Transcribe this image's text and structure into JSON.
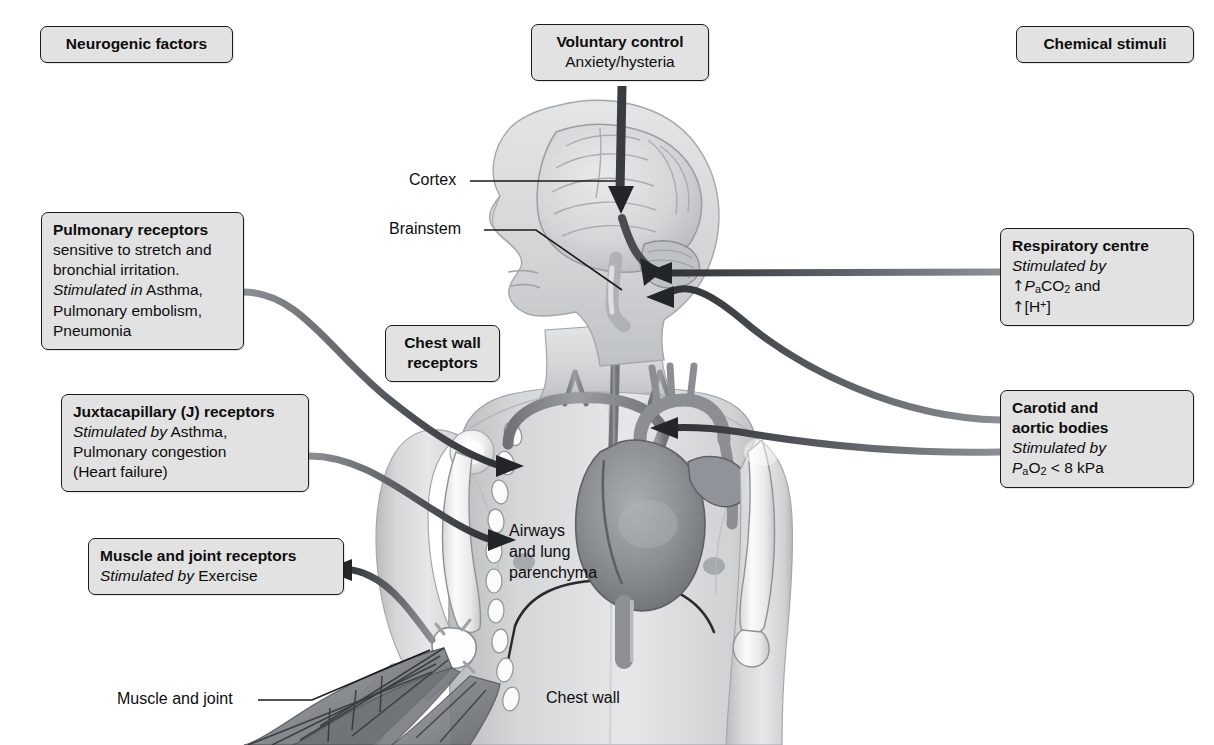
{
  "diagram": {
    "background_color": "#ffffff",
    "box_fill": "#e2e2e2",
    "box_border": "#1b1b1b",
    "arrow_color": "#3a3a3a",
    "body_tint": "#c9cbcd"
  },
  "headers": {
    "left": "Neurogenic factors",
    "right": "Chemical stimuli"
  },
  "boxes": {
    "voluntary_control": {
      "heading": "Voluntary control",
      "line1": "Anxiety/hysteria"
    },
    "pulmonary_receptors": {
      "heading": "Pulmonary receptors",
      "line1": "sensitive to stretch and",
      "line2": "bronchial irritation.",
      "line3_em": "Stimulated in",
      "line3_rest": "Asthma,",
      "line4": "Pulmonary embolism,",
      "line5": "Pneumonia"
    },
    "chest_wall_receptors": {
      "line1": "Chest wall",
      "line2": "receptors"
    },
    "juxtacapillary_receptors": {
      "heading": "Juxtacapillary (J) receptors",
      "line1_em": "Stimulated by",
      "line1_rest": "Asthma,",
      "line2": "Pulmonary congestion",
      "line3": "(Heart failure)"
    },
    "muscle_joint_receptors": {
      "heading": "Muscle and joint receptors",
      "line1_em": "Stimulated by",
      "line1_rest": "Exercise"
    },
    "respiratory_centre": {
      "heading": "Respiratory centre",
      "line1_em": "Stimulated by",
      "line2_arrow": "↑",
      "line2_p": "P",
      "line2_sub": "a",
      "line2_gas": "CO",
      "line2_gas_sub": "2",
      "line2_tail": " and",
      "line3_arrow": "↑",
      "line3_text": "[H",
      "line3_sup": "+",
      "line3_tail": "]"
    },
    "carotid_aortic_bodies": {
      "heading_line1": "Carotid and",
      "heading_line2": "aortic bodies",
      "line1_em": "Stimulated by",
      "line2_p": "P",
      "line2_sub": "a",
      "line2_gas": "O",
      "line2_gas_sub": "2",
      "line2_tail": " < 8 kPa"
    }
  },
  "anatomy_labels": {
    "cortex": "Cortex",
    "brainstem": "Brainstem",
    "airways": "Airways\nand lung\nparenchyma",
    "airways_l1": "Airways",
    "airways_l2": "and lung",
    "airways_l3": "parenchyma",
    "chest_wall": "Chest wall",
    "muscle_and_joint": "Muscle and joint"
  },
  "arrows": [
    {
      "name": "voluntary-to-cortex",
      "from": "voluntary_control",
      "to": "cortex",
      "style": "straight-down"
    },
    {
      "name": "cortex-to-brainstem",
      "from": "cortex",
      "to": "brainstem",
      "style": "curved"
    },
    {
      "name": "respiratory-centre-to-brainstem",
      "from": "respiratory_centre",
      "to": "brainstem",
      "style": "straight-left"
    },
    {
      "name": "carotid-bodies-to-brainstem",
      "from": "carotid_aortic_bodies",
      "to": "brainstem",
      "style": "curved-left"
    },
    {
      "name": "carotid-bodies-to-aortic-arch",
      "from": "carotid_aortic_bodies",
      "to": "aortic_arch",
      "style": "curved-left"
    },
    {
      "name": "pulmonary-receptors-to-lung",
      "from": "pulmonary_receptors",
      "to": "lung",
      "style": "curved-right"
    },
    {
      "name": "juxtacapillary-to-lung",
      "from": "juxtacapillary_receptors",
      "to": "lung",
      "style": "curved-right"
    },
    {
      "name": "muscle-joint-to-box",
      "from": "elbow_joint",
      "to": "muscle_joint_receptors",
      "style": "curved-left"
    }
  ]
}
